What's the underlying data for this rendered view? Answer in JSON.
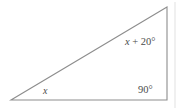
{
  "figure": {
    "type": "geometry-diagram",
    "shape": "right-triangle",
    "background_color": "#ffffff",
    "stroke_color": "#8d8d8d",
    "text_color": "#4a4a4a",
    "vertices": {
      "bottom_left": {
        "x": 11,
        "y": 100
      },
      "bottom_right": {
        "x": 167,
        "y": 100
      },
      "top_right": {
        "x": 167,
        "y": 7
      }
    },
    "labels": {
      "angle_bottom_left": {
        "variable": "x",
        "full_text": "x"
      },
      "angle_bottom_right": {
        "full_text": "90°"
      },
      "angle_top_right": {
        "variable": "x",
        "operator": " + ",
        "addend": "20°",
        "full_text": "x + 20°"
      }
    }
  }
}
